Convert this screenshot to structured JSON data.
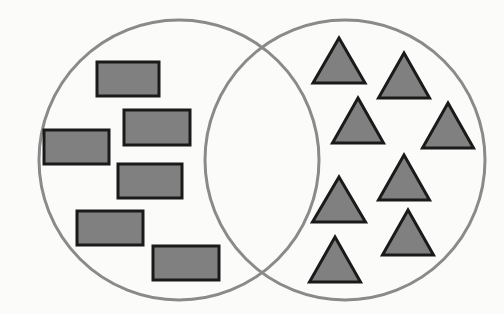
{
  "diagram": {
    "type": "venn",
    "canvas": {
      "width": 504,
      "height": 314,
      "background": "#fbfbfa"
    },
    "style": {
      "circle_stroke": "#8a8a8a",
      "circle_stroke_width": 3,
      "circle_fill": "none",
      "shape_fill": "#808080",
      "shape_stroke": "#1a1a1a",
      "shape_stroke_width": 3
    },
    "circles": [
      {
        "name": "left-set",
        "cx": 179,
        "cy": 160,
        "r": 140
      },
      {
        "name": "right-set",
        "cx": 345,
        "cy": 160,
        "r": 140
      }
    ],
    "counts": {
      "rectangles": 6,
      "triangles": 8,
      "overlap_items": 0
    },
    "rectangles": [
      {
        "id": "rect-1",
        "x": 97,
        "y": 62,
        "w": 62,
        "h": 34
      },
      {
        "id": "rect-2",
        "x": 124,
        "y": 110,
        "w": 66,
        "h": 35
      },
      {
        "id": "rect-3",
        "x": 44,
        "y": 130,
        "w": 65,
        "h": 34
      },
      {
        "id": "rect-4",
        "x": 118,
        "y": 164,
        "w": 64,
        "h": 34
      },
      {
        "id": "rect-5",
        "x": 77,
        "y": 211,
        "w": 66,
        "h": 34
      },
      {
        "id": "rect-6",
        "x": 153,
        "y": 246,
        "w": 66,
        "h": 34
      }
    ],
    "triangles": [
      {
        "id": "tri-1",
        "cx": 339,
        "base_y": 83,
        "w": 52,
        "h": 45
      },
      {
        "id": "tri-2",
        "cx": 404,
        "base_y": 98,
        "w": 51,
        "h": 45
      },
      {
        "id": "tri-3",
        "cx": 358,
        "base_y": 143,
        "w": 51,
        "h": 45
      },
      {
        "id": "tri-4",
        "cx": 448,
        "base_y": 148,
        "w": 51,
        "h": 45
      },
      {
        "id": "tri-5",
        "cx": 404,
        "base_y": 200,
        "w": 51,
        "h": 45
      },
      {
        "id": "tri-6",
        "cx": 339,
        "base_y": 222,
        "w": 53,
        "h": 45
      },
      {
        "id": "tri-7",
        "cx": 408,
        "base_y": 255,
        "w": 51,
        "h": 45
      },
      {
        "id": "tri-8",
        "cx": 335,
        "base_y": 282,
        "w": 51,
        "h": 45
      }
    ]
  }
}
